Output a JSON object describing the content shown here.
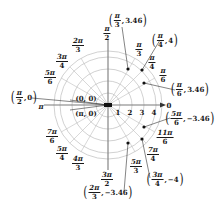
{
  "diagram": {
    "type": "polar-grid",
    "center": [
      108,
      105
    ],
    "unit_px": 12,
    "circle_radii_units": [
      1,
      2,
      3,
      4,
      4.5
    ],
    "ray_angles_deg": [
      0,
      30,
      45,
      60,
      90,
      120,
      135,
      150,
      180,
      210,
      225,
      240,
      270,
      300,
      315,
      330
    ],
    "grid_color": "#bdbdbd",
    "axis_color": "#7a7a7a",
    "point_color": "#111111"
  },
  "axis": {
    "zero_label": "0",
    "pi_label": "π",
    "radial_ticks": [
      "1",
      "2",
      "3",
      "4"
    ]
  },
  "angle_labels": [
    {
      "name": "pi-over-2",
      "num": "π",
      "den": "2"
    },
    {
      "name": "2pi-over-3",
      "num": "2π",
      "den": "3"
    },
    {
      "name": "3pi-over-4",
      "num": "3π",
      "den": "4"
    },
    {
      "name": "5pi-over-6",
      "num": "5π",
      "den": "6"
    },
    {
      "name": "pi-over-3",
      "num": "π",
      "den": "3"
    },
    {
      "name": "pi-over-4",
      "num": "π",
      "den": "4"
    },
    {
      "name": "pi-over-6",
      "num": "π",
      "den": "6"
    },
    {
      "name": "7pi-over-6",
      "num": "7π",
      "den": "6"
    },
    {
      "name": "5pi-over-4",
      "num": "5π",
      "den": "4"
    },
    {
      "name": "4pi-over-3",
      "num": "4π",
      "den": "3"
    },
    {
      "name": "3pi-over-2",
      "num": "3π",
      "den": "2"
    },
    {
      "name": "5pi-over-3",
      "num": "5π",
      "den": "3"
    },
    {
      "name": "7pi-over-4",
      "num": "7π",
      "den": "4"
    },
    {
      "name": "11pi-over-6",
      "num": "11π",
      "den": "6"
    }
  ],
  "points": [
    {
      "name": "point-pi3-346",
      "theta_num": "π",
      "theta_den": "3",
      "r": "3.46"
    },
    {
      "name": "point-pi4-4",
      "theta_num": "π",
      "theta_den": "4",
      "r": "4"
    },
    {
      "name": "point-pi6-346",
      "theta_num": "π",
      "theta_den": "6",
      "r": "3.46"
    },
    {
      "name": "point-5pi6-neg346",
      "theta_num": "5π",
      "theta_den": "6",
      "r": "−3.46"
    },
    {
      "name": "point-3pi4-neg4",
      "theta_num": "3π",
      "theta_den": "4",
      "r": "−4"
    },
    {
      "name": "point-2pi3-neg346",
      "theta_num": "2π",
      "theta_den": "3",
      "r": "−3.46"
    },
    {
      "name": "point-pi2-0",
      "theta_num": "π",
      "theta_den": "2",
      "r": "0"
    }
  ],
  "origin_labels": {
    "zero_zero": "(0, 0)",
    "pi_zero": "(π, 0)"
  }
}
